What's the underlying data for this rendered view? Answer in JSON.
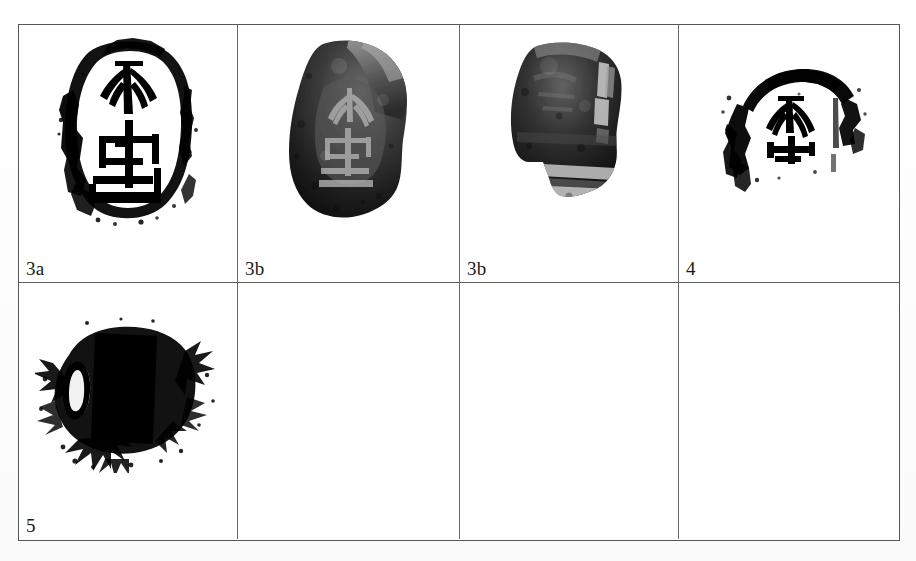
{
  "plate": {
    "description": "Archaeological plate: seal impressions and artifact photographs",
    "columns": 4,
    "rows": 2,
    "border_color": "#565656",
    "background_color": "#ffffff",
    "ink_color": "#000000"
  },
  "cells": [
    {
      "label": "3a",
      "content_type": "seal-impression-drawing",
      "has_content": true,
      "caption_position": "bottom-left"
    },
    {
      "label": "3b",
      "content_type": "artifact-photograph",
      "has_content": true,
      "caption_position": "bottom-left"
    },
    {
      "label": "3b",
      "content_type": "artifact-photograph",
      "has_content": true,
      "caption_position": "bottom-left"
    },
    {
      "label": "4",
      "content_type": "seal-impression-drawing",
      "has_content": true,
      "caption_position": "bottom-left"
    },
    {
      "label": "5",
      "content_type": "seal-rubbing",
      "has_content": true,
      "caption_position": "bottom-left"
    },
    {
      "label": "",
      "content_type": "empty",
      "has_content": false,
      "caption_position": "bottom-left"
    },
    {
      "label": "",
      "content_type": "empty",
      "has_content": false,
      "caption_position": "bottom-left"
    },
    {
      "label": "",
      "content_type": "empty",
      "has_content": false,
      "caption_position": "bottom-left"
    }
  ]
}
